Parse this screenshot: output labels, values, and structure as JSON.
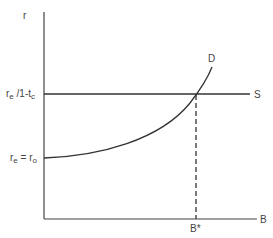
{
  "diagram": {
    "type": "economics-supply-demand",
    "axes": {
      "y_label": "r",
      "x_label": "B"
    },
    "labels": {
      "upper_rate_main": "r",
      "upper_rate_sub1": "e",
      "upper_rate_mid": " /1-t",
      "upper_rate_sub2": "c",
      "lower_rate_main1": "r",
      "lower_rate_sub1": "e",
      "lower_rate_eq": " = r",
      "lower_rate_sub2": "o",
      "supply_curve": "S",
      "demand_curve": "D",
      "equilibrium_quantity": "B*"
    },
    "curves": [
      {
        "name": "S",
        "kind": "horizontal line",
        "level": "r_e/1-t_c"
      },
      {
        "name": "D",
        "kind": "convex increasing curve",
        "starts_at": "r_e = r_o"
      }
    ],
    "intersection": {
      "x_label": "B*",
      "y_label": "r_e/1-t_c",
      "guide": "dashed vertical line"
    },
    "colors": {
      "line": "#333333",
      "text": "#444444",
      "background": "#ffffff"
    }
  }
}
